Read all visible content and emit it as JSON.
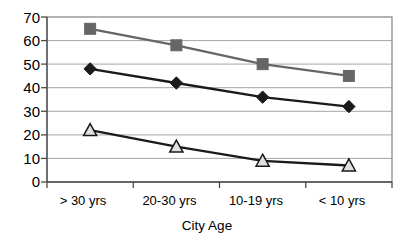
{
  "chart_data": {
    "type": "line",
    "title": "",
    "xlabel": "City Age",
    "ylabel": "",
    "categories": [
      "> 30 yrs",
      "20-30 yrs",
      "10-19 yrs",
      "< 10 yrs"
    ],
    "yticks": [
      0,
      10,
      20,
      30,
      40,
      50,
      60,
      70
    ],
    "ylim": [
      0,
      70
    ],
    "grid": "horizontal",
    "legend": "none",
    "series": [
      {
        "name": "series-square",
        "marker": "square",
        "color": "#666666",
        "marker_fill": "#666666",
        "values": [
          65,
          58,
          50,
          45
        ]
      },
      {
        "name": "series-diamond",
        "marker": "diamond",
        "color": "#1a1a1a",
        "marker_fill": "#1a1a1a",
        "values": [
          48,
          42,
          36,
          32
        ]
      },
      {
        "name": "series-triangle",
        "marker": "triangle",
        "color": "#1a1a1a",
        "marker_fill": "#e0e0e0",
        "values": [
          22,
          15,
          9,
          7
        ]
      }
    ]
  },
  "axis": {
    "y_tick_labels": [
      "70",
      "60",
      "50",
      "40",
      "30",
      "20",
      "10",
      "0"
    ],
    "x_tick_labels": [
      "> 30 yrs",
      "20-30 yrs",
      "10-19 yrs",
      "< 10 yrs"
    ],
    "x_title": "City Age"
  }
}
